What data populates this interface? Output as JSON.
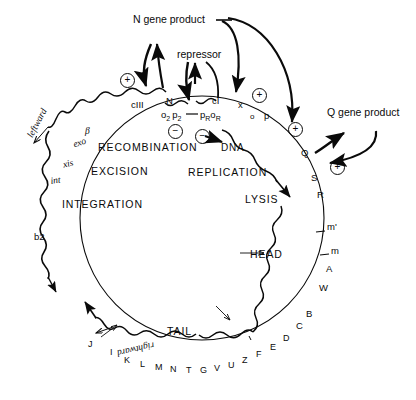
{
  "figure": {
    "background_color": "#ffffff",
    "line_color": "#0a0a0a"
  },
  "external_products": {
    "n_gene_product": "N gene product",
    "repressor": "repressor",
    "q_gene_product": "Q gene product"
  },
  "regulatory_sites": {
    "cIII": "cIII",
    "N": "N",
    "cI": "cI",
    "x": "x",
    "o_small": "o",
    "p_small": "p",
    "Q": "Q",
    "operator_left": "o",
    "operator_left_sub": "2",
    "promoter_left": "p",
    "promoter_left_sub": "2",
    "promoter_right": "p",
    "promoter_right_sub": "R",
    "operator_right": "o",
    "operator_right_sub": "R"
  },
  "signs": {
    "plus": "+",
    "minus": "−"
  },
  "sign_markers": [
    {
      "name": "plus-cIII",
      "sign": "+"
    },
    {
      "name": "plus-x",
      "sign": "+"
    },
    {
      "name": "plus-p",
      "sign": "+"
    },
    {
      "name": "plus-Q",
      "sign": "+"
    },
    {
      "name": "minus-left-operator",
      "sign": "−"
    },
    {
      "name": "minus-dna-replication",
      "sign": "−"
    }
  ],
  "functions": {
    "recombination": "RECOMBINATION",
    "excision": "EXCISION",
    "integration": "INTEGRATION",
    "dna": "DNA",
    "replication": "REPLICATION",
    "lysis": "LYSIS",
    "head": "HEAD",
    "tail": "TAIL"
  },
  "transcription": {
    "leftward": "leftward",
    "rightward": "rightward"
  },
  "left_genes": {
    "beta": "β",
    "exo": "exo",
    "xis": "xis",
    "int": "int",
    "b2": "b2"
  },
  "right_genes": [
    "S",
    "R",
    "m'",
    "m",
    "A",
    "W",
    "B",
    "C"
  ],
  "bottom_genes": [
    "D",
    "E",
    "F",
    "Z",
    "U",
    "V",
    "G",
    "T",
    "N",
    "M",
    "L",
    "K",
    "I",
    "J"
  ],
  "tick_marks": [
    "m'",
    "m"
  ]
}
